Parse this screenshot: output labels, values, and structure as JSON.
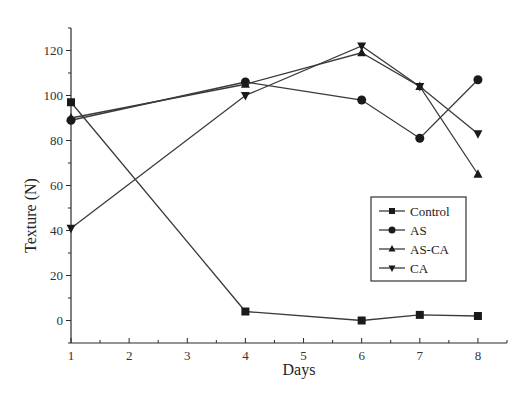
{
  "chart_data": {
    "type": "line",
    "title": "",
    "xlabel": "Days",
    "ylabel": "Texture (N)",
    "xlim": [
      1,
      8.5
    ],
    "ylim": [
      -10,
      130
    ],
    "xticks": [
      1,
      2,
      3,
      4,
      5,
      6,
      7,
      8
    ],
    "yticks": [
      0,
      20,
      40,
      60,
      80,
      100,
      120
    ],
    "grid": false,
    "legend_position": "right",
    "x": [
      1,
      4,
      6,
      7,
      8
    ],
    "series": [
      {
        "name": "Control",
        "marker": "square",
        "values": [
          97,
          4,
          0,
          2.5,
          2
        ]
      },
      {
        "name": "AS",
        "marker": "circle",
        "values": [
          89,
          106,
          98,
          81,
          107
        ]
      },
      {
        "name": "AS-CA",
        "marker": "triangle-up",
        "values": [
          90,
          105,
          119,
          104,
          65
        ]
      },
      {
        "name": "CA",
        "marker": "triangle-down",
        "values": [
          41,
          100,
          122,
          104,
          83
        ]
      }
    ]
  }
}
